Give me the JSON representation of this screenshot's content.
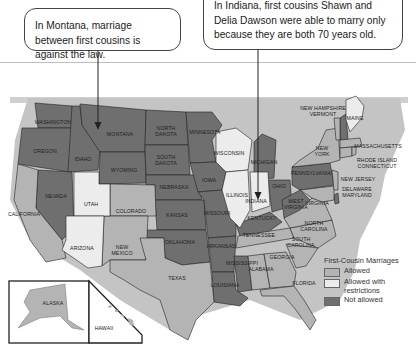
{
  "callouts": {
    "montana": "In Montana, marriage between first cousins is against the law.",
    "indiana": "In Indiana, first cousins Shawn and Delia Dawson were able to marry only because they are both 70 years old."
  },
  "legend": {
    "title": "First-Cousin Marriages",
    "items": [
      {
        "label": "Allowed",
        "color": "#b4b4b4"
      },
      {
        "label": "Allowed with restrictions",
        "color": "#ececec"
      },
      {
        "label": "Not allowed",
        "color": "#6f6f6f"
      }
    ]
  },
  "colors": {
    "allowed": "#b4b4b4",
    "restricted": "#ececec",
    "not_allowed": "#6f6f6f",
    "water": "#c9c9c9"
  },
  "states": {
    "washington": "WASHINGTON",
    "oregon": "OREGON",
    "idaho": "IDAHO",
    "montana": "MONTANA",
    "wyoming": "WYOMING",
    "north_dakota_1": "NORTH",
    "north_dakota_2": "DAKOTA",
    "south_dakota_1": "SOUTH",
    "south_dakota_2": "DAKOTA",
    "minnesota": "MINNESOTA",
    "nebraska": "NEBRASKA",
    "iowa": "IOWA",
    "kansas": "KANSAS",
    "missouri": "MISSOURI",
    "oklahoma": "OKLAHOMA",
    "arkansas": "ARKANSAS",
    "texas": "TEXAS",
    "louisiana": "LOUISIANA",
    "mississippi": "MISSISSIPPI",
    "alabama": "ALABAMA",
    "georgia": "GEORGIA",
    "florida": "FLORIDA",
    "tennessee": "TENNESSEE",
    "kentucky": "KENTUCKY",
    "illinois": "ILLINOIS",
    "indiana": "INDIANA",
    "ohio": "OHIO",
    "michigan": "MICHIGAN",
    "wisconsin": "WISCONSIN",
    "west_virginia_1": "WEST",
    "west_virginia_2": "VIRGINIA",
    "virginia": "VIRGINIA",
    "north_carolina_1": "NORTH",
    "north_carolina_2": "CAROLINA",
    "south_carolina_1": "SOUTH",
    "south_carolina_2": "CAROLINA",
    "pennsylvania": "PENNSYLVANIA",
    "new_york_1": "NEW",
    "new_york_2": "YORK",
    "new_jersey": "NEW JERSEY",
    "delaware": "DELAWARE",
    "maryland": "MARYLAND",
    "new_hampshire": "NEW HAMPSHIRE",
    "vermont": "VERMONT",
    "maine": "MAINE",
    "massachusetts": "MASSACHUSETTS",
    "rhode_island": "RHODE ISLAND",
    "connecticut": "CONNECTICUT",
    "california": "CALIFORNIA",
    "nevada": "NEVADA",
    "utah": "UTAH",
    "colorado": "COLORADO",
    "arizona": "ARIZONA",
    "new_mexico_1": "NEW",
    "new_mexico_2": "MEXICO",
    "alaska": "ALASKA",
    "hawaii": "HAWAII"
  }
}
